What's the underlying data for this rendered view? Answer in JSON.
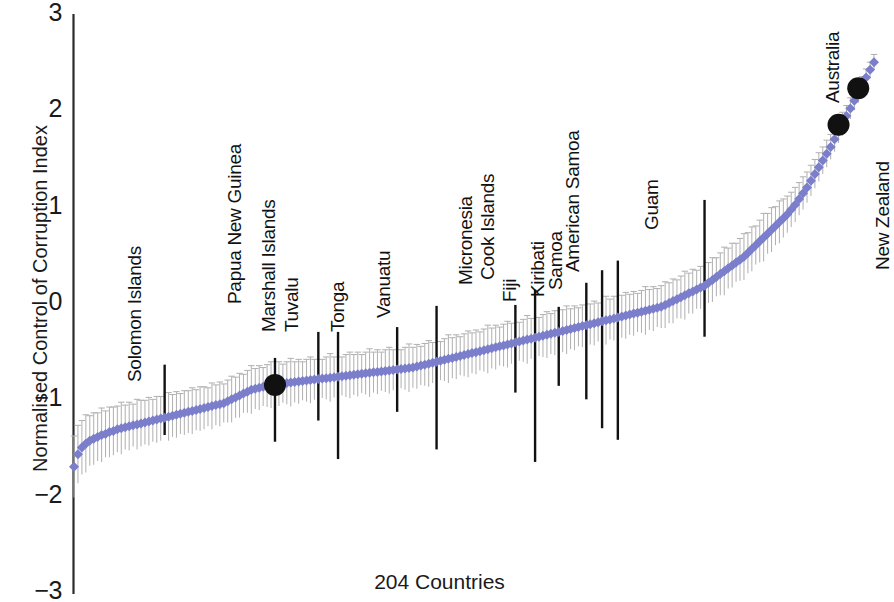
{
  "chart_data": {
    "type": "scatter",
    "title": "",
    "xlabel": "204 Countries",
    "ylabel": "Normalised Control of Corruption Index",
    "ylim": [
      -3,
      3
    ],
    "yticks": [
      3,
      2,
      1,
      0,
      -1,
      -2,
      -3
    ],
    "ytick_labels": [
      "3",
      "2",
      "1",
      "0",
      "−1",
      "−2",
      "−3"
    ],
    "xlim": [
      1,
      204
    ],
    "grid": false,
    "legend": null,
    "n_points": 204,
    "marker": "diamond",
    "series_color": "#7b7ecb",
    "errorbar_color": "#b3b3b3",
    "highlight_errorbar_color": "#111111",
    "highlight_marker_color": "#111111",
    "values": [
      -1.7,
      -1.57,
      -1.5,
      -1.46,
      -1.43,
      -1.41,
      -1.39,
      -1.37,
      -1.36,
      -1.34,
      -1.33,
      -1.31,
      -1.3,
      -1.29,
      -1.28,
      -1.27,
      -1.26,
      -1.25,
      -1.24,
      -1.23,
      -1.22,
      -1.21,
      -1.2,
      -1.19,
      -1.18,
      -1.17,
      -1.16,
      -1.15,
      -1.14,
      -1.13,
      -1.12,
      -1.11,
      -1.1,
      -1.09,
      -1.08,
      -1.07,
      -1.06,
      -1.05,
      -1.04,
      -1.02,
      -1.0,
      -0.98,
      -0.96,
      -0.94,
      -0.92,
      -0.9,
      -0.89,
      -0.88,
      -0.87,
      -0.86,
      -0.85,
      -0.845,
      -0.84,
      -0.835,
      -0.83,
      -0.825,
      -0.82,
      -0.815,
      -0.81,
      -0.805,
      -0.8,
      -0.795,
      -0.79,
      -0.785,
      -0.78,
      -0.775,
      -0.77,
      -0.765,
      -0.76,
      -0.755,
      -0.75,
      -0.745,
      -0.74,
      -0.735,
      -0.73,
      -0.725,
      -0.72,
      -0.715,
      -0.71,
      -0.705,
      -0.7,
      -0.695,
      -0.69,
      -0.685,
      -0.68,
      -0.675,
      -0.67,
      -0.66,
      -0.65,
      -0.64,
      -0.63,
      -0.62,
      -0.61,
      -0.6,
      -0.59,
      -0.58,
      -0.57,
      -0.56,
      -0.55,
      -0.54,
      -0.53,
      -0.52,
      -0.51,
      -0.5,
      -0.49,
      -0.48,
      -0.47,
      -0.46,
      -0.45,
      -0.44,
      -0.43,
      -0.42,
      -0.41,
      -0.4,
      -0.39,
      -0.38,
      -0.37,
      -0.36,
      -0.35,
      -0.34,
      -0.33,
      -0.32,
      -0.31,
      -0.3,
      -0.29,
      -0.28,
      -0.27,
      -0.26,
      -0.25,
      -0.24,
      -0.23,
      -0.22,
      -0.21,
      -0.2,
      -0.19,
      -0.18,
      -0.17,
      -0.16,
      -0.15,
      -0.14,
      -0.13,
      -0.12,
      -0.11,
      -0.1,
      -0.09,
      -0.08,
      -0.07,
      -0.06,
      -0.05,
      -0.04,
      -0.02,
      0.0,
      0.02,
      0.04,
      0.06,
      0.08,
      0.1,
      0.12,
      0.14,
      0.16,
      0.18,
      0.21,
      0.24,
      0.27,
      0.3,
      0.33,
      0.36,
      0.39,
      0.42,
      0.45,
      0.48,
      0.52,
      0.56,
      0.6,
      0.64,
      0.68,
      0.72,
      0.76,
      0.8,
      0.84,
      0.88,
      0.92,
      0.97,
      1.02,
      1.08,
      1.14,
      1.2,
      1.27,
      1.34,
      1.41,
      1.48,
      1.55,
      1.62,
      1.7,
      1.78,
      1.86,
      1.94,
      2.02,
      2.1,
      2.18,
      2.26,
      2.34,
      2.42,
      2.5
    ],
    "errors": [
      0.32,
      0.3,
      0.28,
      0.3,
      0.26,
      0.27,
      0.25,
      0.28,
      0.24,
      0.26,
      0.25,
      0.24,
      0.27,
      0.23,
      0.25,
      0.22,
      0.26,
      0.24,
      0.23,
      0.25,
      0.22,
      0.24,
      0.23,
      0.21,
      0.25,
      0.22,
      0.24,
      0.21,
      0.23,
      0.22,
      0.24,
      0.21,
      0.23,
      0.22,
      0.2,
      0.24,
      0.21,
      0.23,
      0.2,
      0.22,
      0.24,
      0.21,
      0.23,
      0.2,
      0.22,
      0.25,
      0.21,
      0.23,
      0.2,
      0.22,
      0.24,
      0.21,
      0.23,
      0.2,
      0.22,
      0.25,
      0.21,
      0.23,
      0.2,
      0.22,
      0.24,
      0.21,
      0.23,
      0.2,
      0.22,
      0.25,
      0.21,
      0.23,
      0.2,
      0.22,
      0.24,
      0.21,
      0.23,
      0.2,
      0.22,
      0.25,
      0.21,
      0.23,
      0.2,
      0.22,
      0.24,
      0.21,
      0.23,
      0.2,
      0.22,
      0.25,
      0.21,
      0.23,
      0.2,
      0.22,
      0.24,
      0.21,
      0.23,
      0.2,
      0.22,
      0.25,
      0.21,
      0.23,
      0.2,
      0.22,
      0.24,
      0.21,
      0.23,
      0.2,
      0.22,
      0.25,
      0.21,
      0.23,
      0.2,
      0.22,
      0.24,
      0.21,
      0.23,
      0.2,
      0.22,
      0.25,
      0.21,
      0.23,
      0.2,
      0.22,
      0.24,
      0.21,
      0.23,
      0.2,
      0.22,
      0.25,
      0.21,
      0.23,
      0.2,
      0.22,
      0.24,
      0.21,
      0.23,
      0.2,
      0.22,
      0.25,
      0.21,
      0.23,
      0.2,
      0.22,
      0.24,
      0.21,
      0.23,
      0.2,
      0.22,
      0.25,
      0.21,
      0.23,
      0.2,
      0.22,
      0.24,
      0.21,
      0.23,
      0.2,
      0.22,
      0.25,
      0.21,
      0.23,
      0.2,
      0.22,
      0.24,
      0.21,
      0.23,
      0.2,
      0.22,
      0.25,
      0.21,
      0.23,
      0.2,
      0.22,
      0.24,
      0.21,
      0.23,
      0.2,
      0.22,
      0.25,
      0.21,
      0.23,
      0.2,
      0.22,
      0.2,
      0.19,
      0.18,
      0.18,
      0.17,
      0.17,
      0.16,
      0.16,
      0.15,
      0.15,
      0.14,
      0.14,
      0.13,
      0.13,
      0.12,
      0.12,
      0.11,
      0.11,
      0.1,
      0.1,
      0.09,
      0.09,
      0.08,
      0.08
    ],
    "highlights": [
      {
        "name": "Solomon Islands",
        "index": 23,
        "value": -1.05,
        "err_low": -1.37,
        "err_high": -0.64,
        "marker": false,
        "label_x": 124,
        "label_y": 382
      },
      {
        "name": "Papua New Guinea",
        "index": 51,
        "value": -0.85,
        "err_low": -1.44,
        "err_high": -0.57,
        "marker": true,
        "label_x": 224,
        "label_y": 304
      },
      {
        "name": "Marshall Islands",
        "index": 62,
        "value": -0.77,
        "err_low": -1.22,
        "err_high": -0.3,
        "marker": false,
        "label_x": 258,
        "label_y": 332
      },
      {
        "name": "Tuvalu",
        "index": 67,
        "value": -0.72,
        "err_low": -1.62,
        "err_high": -0.3,
        "marker": false,
        "label_x": 281,
        "label_y": 332
      },
      {
        "name": "Tonga",
        "index": 82,
        "value": -0.67,
        "err_low": -1.13,
        "err_high": -0.25,
        "marker": false,
        "label_x": 327,
        "label_y": 332
      },
      {
        "name": "Vanuatu",
        "index": 92,
        "value": -0.6,
        "err_low": -1.52,
        "err_high": -0.03,
        "marker": false,
        "label_x": 373,
        "label_y": 318
      },
      {
        "name": "Micronesia",
        "index": 112,
        "value": -0.45,
        "err_low": -0.93,
        "err_high": -0.02,
        "marker": false,
        "label_x": 455,
        "label_y": 285
      },
      {
        "name": "Cook Islands",
        "index": 117,
        "value": -0.4,
        "err_low": -1.65,
        "err_high": 0.14,
        "marker": false,
        "label_x": 477,
        "label_y": 280
      },
      {
        "name": "Fiji",
        "index": 123,
        "value": -0.33,
        "err_low": -0.86,
        "err_high": -0.04,
        "marker": false,
        "label_x": 499,
        "label_y": 302
      },
      {
        "name": "Kiribati",
        "index": 130,
        "value": -0.25,
        "err_low": -1.0,
        "err_high": 0.21,
        "marker": false,
        "label_x": 527,
        "label_y": 297
      },
      {
        "name": "Samoa",
        "index": 134,
        "value": -0.2,
        "err_low": -1.3,
        "err_high": 0.34,
        "marker": false,
        "label_x": 545,
        "label_y": 290
      },
      {
        "name": "American Samoa",
        "index": 138,
        "value": -0.15,
        "err_low": -1.42,
        "err_high": 0.44,
        "marker": false,
        "label_x": 562,
        "label_y": 272
      },
      {
        "name": "Guam",
        "index": 160,
        "value": 0.2,
        "err_low": -0.35,
        "err_high": 1.07,
        "marker": false,
        "label_x": 641,
        "label_y": 230
      },
      {
        "name": "Australia",
        "index": 194,
        "value": 1.85,
        "err_low": null,
        "err_high": null,
        "marker": true,
        "label_x": 822,
        "label_y": 103
      },
      {
        "name": "New Zealand",
        "index": 199,
        "value": 2.23,
        "err_low": null,
        "err_high": null,
        "marker": true,
        "label_x": 872,
        "label_y": 270
      }
    ]
  },
  "axes": {
    "y_title": "Normalised Control of Corruption Index",
    "x_title": "204 Countries",
    "y_ticks": [
      {
        "label": "3",
        "value": 3
      },
      {
        "label": "2",
        "value": 2
      },
      {
        "label": "1",
        "value": 1
      },
      {
        "label": "0",
        "value": 0
      },
      {
        "label": "−1",
        "value": -1
      },
      {
        "label": "−2",
        "value": -2
      },
      {
        "label": "−3",
        "value": -3
      }
    ]
  }
}
